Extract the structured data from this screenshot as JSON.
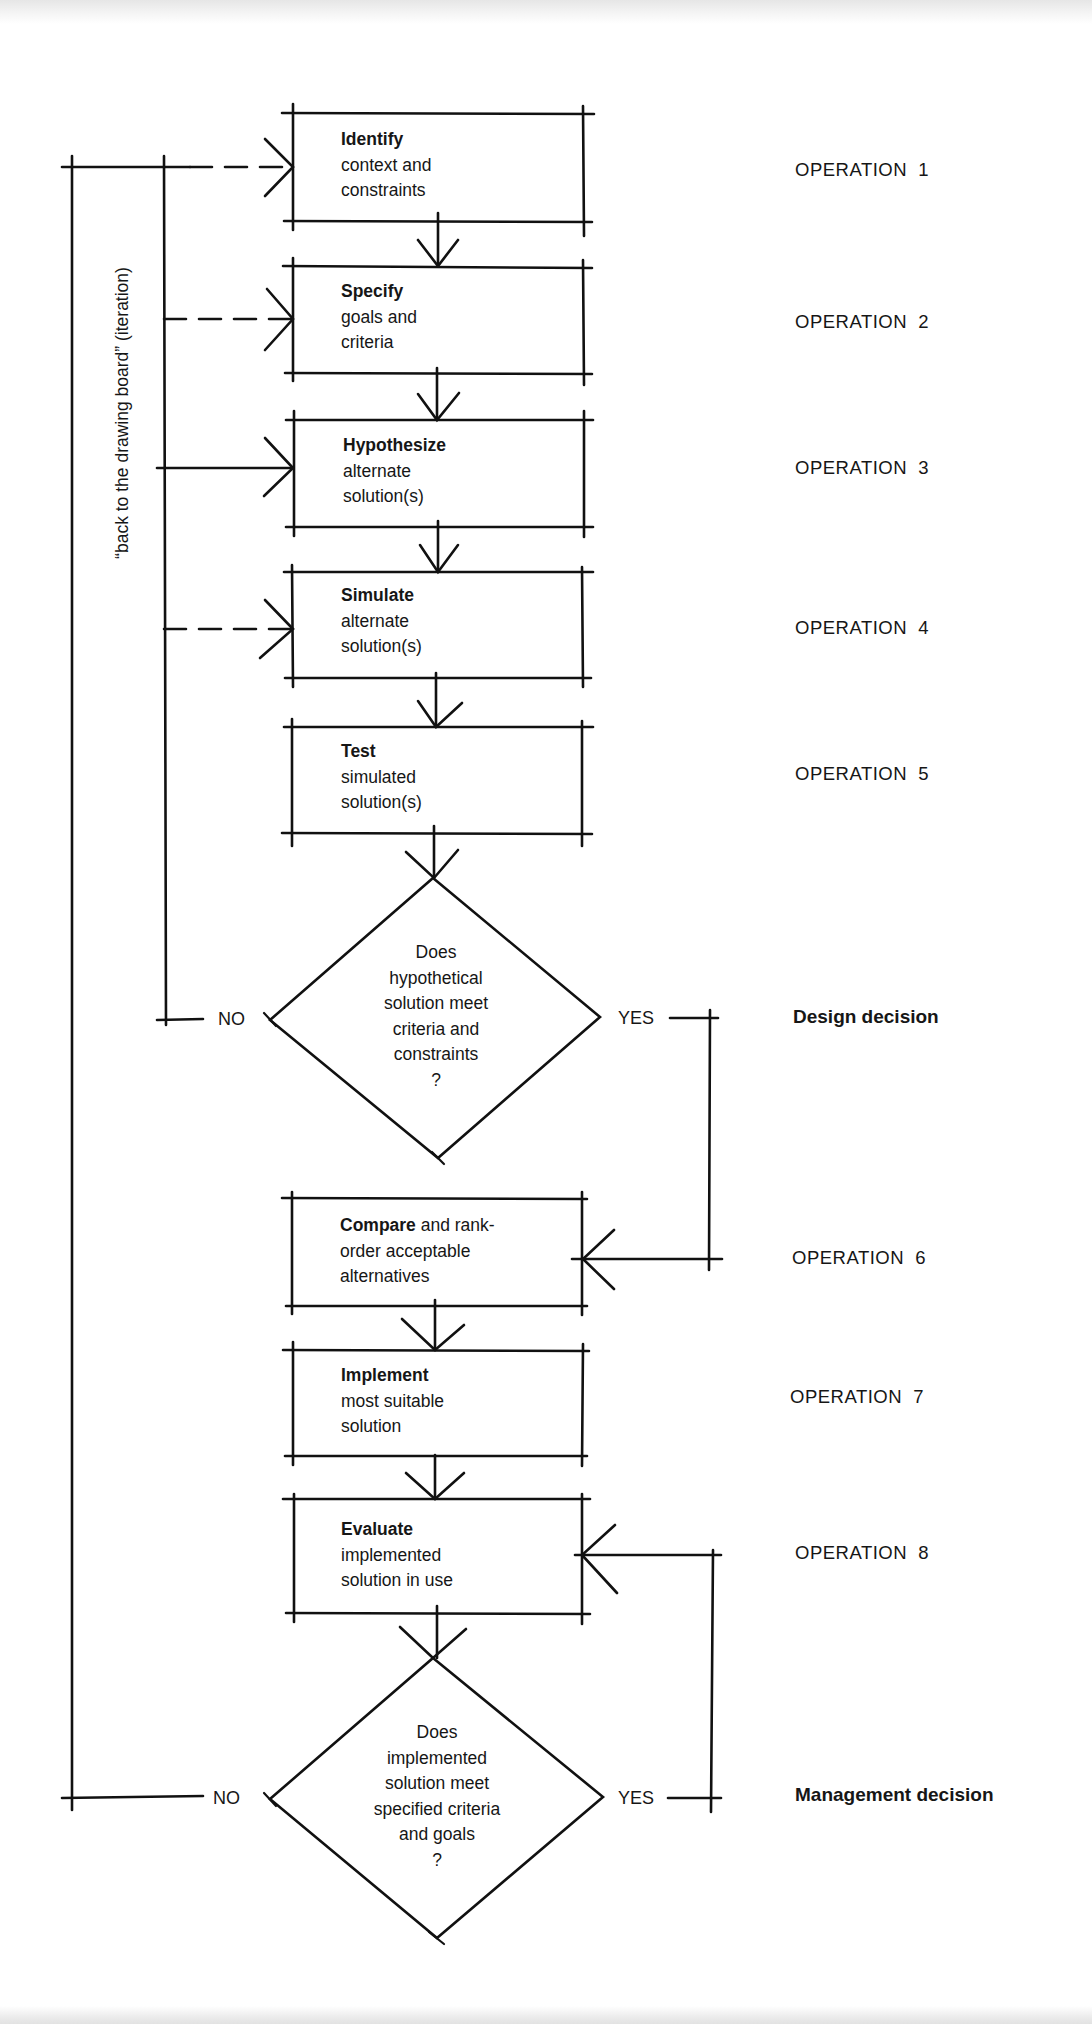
{
  "diagram": {
    "iteration_label": "“back to the drawing board” (iteration)",
    "boxes": [
      {
        "title": "Identify",
        "lines": [
          "context and",
          "constraints"
        ],
        "operation": "OPERATION  1"
      },
      {
        "title": "Specify",
        "lines": [
          "goals and",
          "criteria"
        ],
        "operation": "OPERATION  2"
      },
      {
        "title": "Hypothesize",
        "lines": [
          "alternate",
          "solution(s)"
        ],
        "operation": "OPERATION  3"
      },
      {
        "title": "Simulate",
        "lines": [
          "alternate",
          "solution(s)"
        ],
        "operation": "OPERATION  4"
      },
      {
        "title": "Test",
        "lines": [
          "simulated",
          "solution(s)"
        ],
        "operation": "OPERATION  5"
      },
      {
        "title": "Compare",
        "title_suffix": " and rank-",
        "lines": [
          "order acceptable",
          "alternatives"
        ],
        "operation": "OPERATION  6"
      },
      {
        "title": "Implement",
        "lines": [
          "most suitable",
          "solution"
        ],
        "operation": "OPERATION  7"
      },
      {
        "title": "Evaluate",
        "lines": [
          "implemented",
          "solution in use"
        ],
        "operation": "OPERATION  8"
      }
    ],
    "decisions": [
      {
        "lines": [
          "Does",
          "hypothetical",
          "solution meet",
          "criteria and",
          "constraints",
          "?"
        ],
        "no_label": "NO",
        "yes_label": "YES",
        "side_label": "Design decision"
      },
      {
        "lines": [
          "Does",
          "implemented",
          "solution meet",
          "specified criteria",
          "and goals",
          "?"
        ],
        "no_label": "NO",
        "yes_label": "YES",
        "side_label": "Management decision"
      }
    ]
  }
}
